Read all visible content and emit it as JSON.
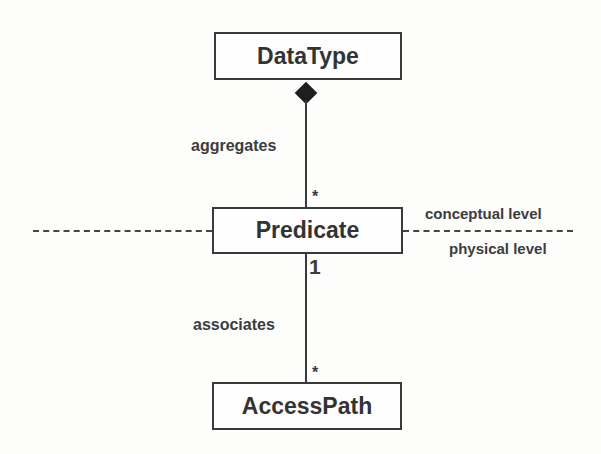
{
  "diagram": {
    "classes": [
      {
        "id": "datatype",
        "name": "DataType"
      },
      {
        "id": "predicate",
        "name": "Predicate"
      },
      {
        "id": "accesspath",
        "name": "AccessPath"
      }
    ],
    "associations": [
      {
        "label": "aggregates",
        "from": "DataType",
        "to": "Predicate",
        "from_end": "composition-diamond",
        "to_multiplicity": "*"
      },
      {
        "label": "associates",
        "from": "Predicate",
        "to": "AccessPath",
        "from_multiplicity": "1",
        "to_multiplicity": "*"
      }
    ],
    "levels": {
      "upper": "conceptual level",
      "lower": "physical level"
    }
  }
}
